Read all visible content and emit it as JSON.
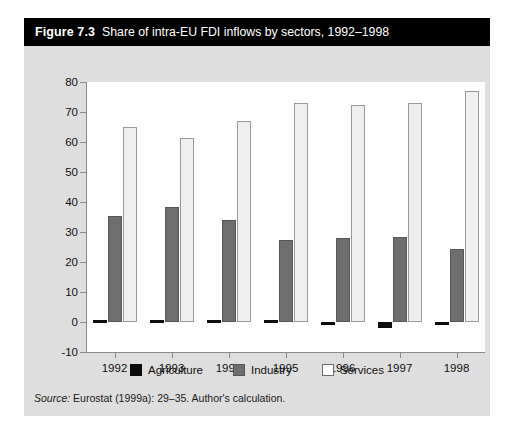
{
  "figure": {
    "number": "Figure 7.3",
    "caption": "Share of intra-EU FDI inflows by sectors, 1992–1998",
    "source_word": "Source:",
    "source_text": " Eurostat (1999a): 29–35. Author's calculation."
  },
  "colors": {
    "title_bar": "#000000",
    "panel": "#dedede",
    "plot_background": "#ffffff",
    "agriculture": "#0d0d0d",
    "industry": "#6e6e6e",
    "services": "#efefef",
    "axis": "#8a8a8a"
  },
  "legend": {
    "position": "bottom-center",
    "items": [
      {
        "label": "Agriculture",
        "key": "agriculture"
      },
      {
        "label": "Industry",
        "key": "industry"
      },
      {
        "label": "Services",
        "key": "services"
      }
    ]
  },
  "chart_data": {
    "type": "bar",
    "title": "Share of intra-EU FDI inflows by sectors, 1992–1998",
    "subtitle": "",
    "xlabel": "",
    "ylabel": "",
    "categories": [
      "1992",
      "1993",
      "1994",
      "1995",
      "1996",
      "1997",
      "1998"
    ],
    "series": [
      {
        "name": "Agriculture",
        "values": [
          0.8,
          0.6,
          0.8,
          0.7,
          -0.8,
          -2.0,
          -1.0
        ]
      },
      {
        "name": "Industry",
        "values": [
          35.5,
          38.5,
          34.0,
          27.5,
          28.0,
          28.5,
          24.5
        ]
      },
      {
        "name": "Services",
        "values": [
          65.0,
          61.5,
          67.0,
          73.0,
          72.5,
          73.0,
          77.0
        ]
      }
    ],
    "ylim": [
      -10,
      80
    ],
    "ytick_values": [
      -10,
      0,
      10,
      20,
      30,
      40,
      50,
      60,
      70,
      80
    ],
    "ytick_labels": [
      "-10",
      "0",
      "10",
      "20",
      "30",
      "40",
      "50",
      "60",
      "70",
      "80"
    ],
    "grid": false,
    "legend_position": "bottom"
  }
}
